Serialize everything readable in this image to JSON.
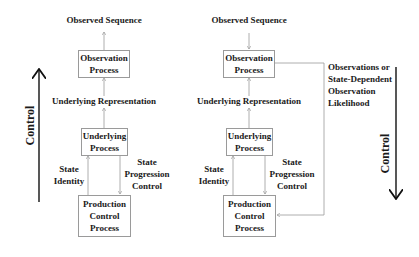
{
  "diagrams": [
    {
      "observed_sequence": "Observed Sequence",
      "observation_process": [
        "Observation",
        "Process"
      ],
      "underlying_representation": "Underlying Representation",
      "underlying_process": [
        "Underlying",
        "Process"
      ],
      "state_identity": [
        "State",
        "Identity"
      ],
      "state_progression_control": [
        "State",
        "Progression",
        "Control"
      ],
      "production_control_process": [
        "Production",
        "Control",
        "Process"
      ],
      "control_label": "Control",
      "control_direction": "up"
    },
    {
      "observed_sequence": "Observed Sequence",
      "observation_process": [
        "Observation",
        "Process"
      ],
      "underlying_representation": "Underlying Representation",
      "underlying_process": [
        "Underlying",
        "Process"
      ],
      "state_identity": [
        "State",
        "Identity"
      ],
      "state_progression_control": [
        "State",
        "Progression",
        "Control"
      ],
      "production_control_process": [
        "Production",
        "Control",
        "Process"
      ],
      "feedback_label": [
        "Observations or",
        "State-Dependent",
        "Observation",
        "Likelihood"
      ],
      "control_label": "Control",
      "control_direction": "down"
    }
  ],
  "colors": {
    "text": "#1a1a1a",
    "box_border": "#9a9a9a",
    "connector": "#9a9a9a",
    "control_arrow": "#111111"
  }
}
